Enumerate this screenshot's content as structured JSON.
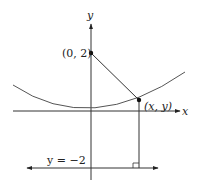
{
  "diagram": {
    "type": "parabola-focus-directrix",
    "axes": {
      "x_label": "x",
      "y_label": "y"
    },
    "focus": {
      "label": "(0, 2)",
      "coords": [
        0,
        2
      ]
    },
    "point_on_curve": {
      "label": "(x, y)"
    },
    "directrix": {
      "label": "y = −2",
      "equation_y": -2
    },
    "colors": {
      "line": "#333333",
      "curve": "#555555",
      "point": "#111111"
    }
  }
}
